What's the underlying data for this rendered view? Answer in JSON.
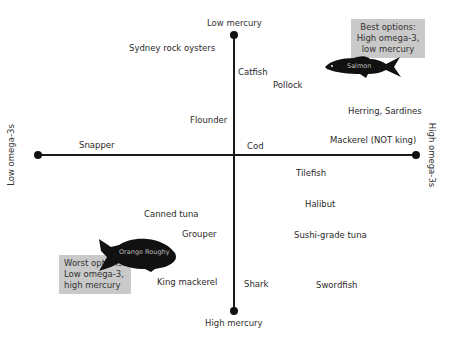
{
  "axes": {
    "top": "Low mercury",
    "bottom": "High mercury",
    "left": "Low omega-3s",
    "right": "High omega-3s"
  },
  "fish": [
    {
      "name": "Sydney rock oysters",
      "x": 129,
      "y": 43
    },
    {
      "name": "Catfish",
      "x": 238,
      "y": 67
    },
    {
      "name": "Pollock",
      "x": 273,
      "y": 80
    },
    {
      "name": "Herring, Sardines",
      "x": 348,
      "y": 107
    },
    {
      "name": "Flounder",
      "x": 190,
      "y": 115
    },
    {
      "name": "Snapper",
      "x": 79,
      "y": 140
    },
    {
      "name": "Cod",
      "x": 247,
      "y": 141
    },
    {
      "name": "Mackerel (NOT king)",
      "x": 330,
      "y": 135
    },
    {
      "name": "Tilefish",
      "x": 296,
      "y": 168
    },
    {
      "name": "Halibut",
      "x": 305,
      "y": 199
    },
    {
      "name": "Canned tuna",
      "x": 144,
      "y": 209
    },
    {
      "name": "Grouper",
      "x": 182,
      "y": 229
    },
    {
      "name": "Sushi-grade tuna",
      "x": 294,
      "y": 230
    },
    {
      "name": "King mackerel",
      "x": 157,
      "y": 277
    },
    {
      "name": "Shark",
      "x": 244,
      "y": 279
    },
    {
      "name": "Swordfish",
      "x": 316,
      "y": 280
    }
  ],
  "callouts": {
    "best": {
      "line1": "Best options:",
      "line2": "High omega-3,",
      "line3": "low mercury"
    },
    "worst": {
      "line1": "Worst options:",
      "line2": "Low omega-3,",
      "line3": "high mercury"
    }
  },
  "featured": {
    "salmon": "Salmon",
    "orange_roughy": "Orange Roughy"
  },
  "colors": {
    "axis": "#1a1a1a",
    "callout_bg": "#c9c9c9",
    "fish_silhouette": "#111111"
  }
}
